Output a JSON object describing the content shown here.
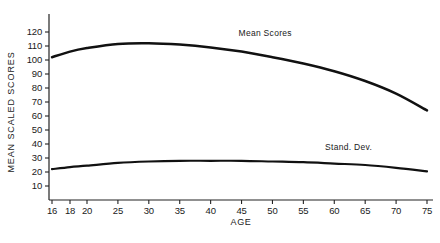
{
  "chart_data": {
    "type": "line",
    "title": "",
    "xlabel": "AGE",
    "ylabel": "MEAN SCALED SCORES",
    "xlim": [
      16,
      77
    ],
    "ylim": [
      0,
      125
    ],
    "grid": false,
    "legend_position": "inline-annotations",
    "x_tick_labels": [
      "16",
      "18",
      "20",
      "25",
      "30",
      "35",
      "40",
      "45",
      "50",
      "55",
      "60",
      "65",
      "70",
      "75"
    ],
    "x_tick_values": [
      16,
      18,
      20,
      25,
      30,
      35,
      40,
      45,
      50,
      55,
      60,
      65,
      70,
      75
    ],
    "y_tick_labels": [
      "10",
      "20",
      "30",
      "40",
      "50",
      "60",
      "70",
      "80",
      "90",
      "100",
      "110",
      "120"
    ],
    "y_tick_values": [
      10,
      20,
      30,
      40,
      50,
      60,
      70,
      80,
      90,
      100,
      110,
      120
    ],
    "x": [
      16,
      18,
      20,
      25,
      30,
      35,
      40,
      45,
      50,
      55,
      60,
      65,
      70,
      75
    ],
    "series": [
      {
        "name": "Mean Scores",
        "label": "Mean Scores",
        "color": "#111111",
        "values": [
          102,
          106,
          108.5,
          111.5,
          112,
          111,
          109,
          106,
          102,
          97.5,
          92,
          85,
          76,
          64
        ]
      },
      {
        "name": "Stand. Dev.",
        "label": "Stand. Dev.",
        "color": "#111111",
        "values": [
          22,
          23.5,
          24.5,
          26.5,
          27.5,
          28,
          28,
          28,
          27.5,
          27,
          26,
          25,
          23,
          20.5
        ]
      }
    ],
    "annotations": [
      {
        "text": "Mean Scores",
        "x": 44.5,
        "y": 117
      },
      {
        "text": "Stand. Dev.",
        "x": 58.5,
        "y": 36
      }
    ]
  }
}
